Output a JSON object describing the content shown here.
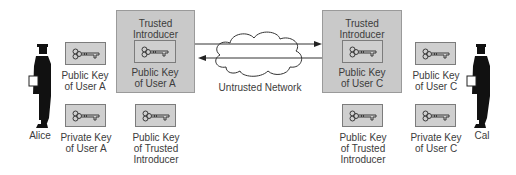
{
  "diagram": {
    "network": {
      "label": "Untrusted Network"
    },
    "left": {
      "person": {
        "name": "Alice"
      },
      "keys": [
        {
          "label_line1": "Public Key",
          "label_line2": "of User A"
        },
        {
          "label_line1": "Private Key",
          "label_line2": "of User A"
        },
        {
          "label_line1": "Public Key",
          "label_line2": "of Trusted",
          "label_line3": "Introducer"
        }
      ],
      "introducer": {
        "title_line1": "Trusted",
        "title_line2": "Introducer",
        "key_label_line1": "Public Key",
        "key_label_line2": "of User A"
      }
    },
    "right": {
      "person": {
        "name": "Cal"
      },
      "keys": [
        {
          "label_line1": "Public Key",
          "label_line2": "of User C"
        },
        {
          "label_line1": "Private Key",
          "label_line2": "of User C"
        },
        {
          "label_line1": "Public Key",
          "label_line2": "of Trusted",
          "label_line3": "Introducer"
        }
      ],
      "introducer": {
        "title_line1": "Trusted",
        "title_line2": "Introducer",
        "key_label_line1": "Public Key",
        "key_label_line2": "of User C"
      }
    },
    "arrows": [
      {
        "direction": "right",
        "from": "left-introducer",
        "to": "right-introducer"
      },
      {
        "direction": "left",
        "from": "right-introducer",
        "to": "left-introducer"
      }
    ],
    "colors": {
      "box_fill": "#c9c9c9",
      "key_fill": "#cfcfcf",
      "text": "#3c3c3c",
      "silhouette": "#111111"
    }
  }
}
